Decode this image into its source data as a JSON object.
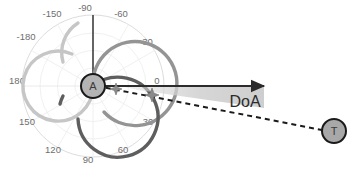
{
  "figure": {
    "background_color": "#ffffff",
    "width": 356,
    "height": 173
  },
  "polar_plot": {
    "center": {
      "x": 93,
      "y": 86
    },
    "outer_radius": 71,
    "grid_color": "#d9d9d9",
    "tick_label_color": "#6e6e6e",
    "angle_ticks": [
      {
        "label": "-180",
        "angle_deg": 180,
        "x": 26,
        "y": 40
      },
      {
        "label": "-150",
        "angle_deg": -150,
        "x": 52,
        "y": 17
      },
      {
        "label": "-90",
        "angle_deg": -90,
        "x": 85,
        "y": 9
      },
      {
        "label": "-60",
        "angle_deg": -60,
        "x": 120,
        "y": 17
      },
      {
        "label": "-30",
        "angle_deg": -30,
        "x": 146,
        "y": 44
      },
      {
        "label": "0",
        "angle_deg": 0,
        "x": 158,
        "y": 83
      },
      {
        "label": "30",
        "angle_deg": 30,
        "x": 146,
        "y": 122
      },
      {
        "label": "60",
        "angle_deg": 60,
        "x": 120,
        "y": 150
      },
      {
        "label": "90",
        "angle_deg": 90,
        "x": 86,
        "y": 160
      },
      {
        "label": "120",
        "angle_deg": 120,
        "x": 52,
        "y": 150
      },
      {
        "label": "150",
        "angle_deg": 150,
        "x": 26,
        "y": 122
      },
      {
        "label": "180",
        "angle_deg": 180,
        "x": 17,
        "y": 83
      }
    ]
  },
  "beam_lobes": [
    {
      "name": "lobe-upper-left",
      "color": "#c6c6c6",
      "center": {
        "x": 93,
        "y": 51
      },
      "radius": 35,
      "stroke_width": 3.2,
      "bearing_deg": -90
    },
    {
      "name": "lobe-right",
      "color": "#949494",
      "center": {
        "x": 118,
        "y": 71
      },
      "radius": 42,
      "stroke_width": 3.2,
      "bearing_deg": -30
    },
    {
      "name": "lobe-lower",
      "color": "#5e5e5e",
      "center": {
        "x": 96,
        "y": 114
      },
      "radius": 40,
      "stroke_width": 3.2,
      "bearing_deg": 90
    }
  ],
  "nodes": [
    {
      "name": "anchor-node",
      "label": "A",
      "x": 93,
      "y": 86,
      "radius": 12,
      "fill": "#b4b4b4",
      "stroke": "#1a1a1a",
      "stroke_width": 2
    },
    {
      "name": "target-node",
      "label": "T",
      "x": 334,
      "y": 131,
      "radius": 12,
      "fill": "#a8a8a8",
      "stroke": "#1a1a1a",
      "stroke_width": 2
    }
  ],
  "reference_arrow": {
    "name": "reference-axis-arrow",
    "from": {
      "x": 93,
      "y": 86
    },
    "to": {
      "x": 268,
      "y": 86
    },
    "color": "#2b2b2b",
    "stroke_width": 2.2
  },
  "bearing_line": {
    "name": "doa-dashed-bearing-line",
    "from": {
      "x": 93,
      "y": 86
    },
    "to": {
      "x": 322,
      "y": 130
    },
    "color": "#1a1a1a",
    "stroke_width": 2,
    "dash": "5 4",
    "markers": [
      {
        "name": "bearing-marker-1",
        "x": 116,
        "y": 89,
        "size": 6,
        "color": "#8a8a8a"
      },
      {
        "name": "bearing-marker-2",
        "x": 152,
        "y": 95,
        "size": 7,
        "color": "#8a8a8a"
      }
    ]
  },
  "doa_wedge": {
    "name": "doa-angle-wedge",
    "label": "DoA",
    "label_x": 244,
    "label_y": 100,
    "fill": "#d2d2d2",
    "opacity": 0.85,
    "apex": {
      "x": 120,
      "y": 86
    },
    "points": "120,86 262,86 262,107 136,89"
  }
}
